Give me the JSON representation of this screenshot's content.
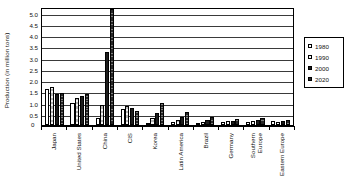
{
  "chart_data": {
    "type": "bar",
    "title": "",
    "xlabel": "",
    "ylabel": "Production (in million tons)",
    "ylim": [
      0,
      5.25
    ],
    "grid": true,
    "legend_position": "right",
    "yticks": [
      "5.0",
      "4.5",
      "4.0",
      "3.5",
      "3.0",
      "2.5",
      "2.0",
      "1.5",
      "1.0",
      "0.5"
    ],
    "ytick_values": [
      5.0,
      4.5,
      4.0,
      3.5,
      3.0,
      2.5,
      2.0,
      1.5,
      1.0,
      0.5
    ],
    "zero_label": "0",
    "categories": [
      "Japan",
      "United States",
      "China",
      "CIS",
      "Korea",
      "Latin America",
      "Brazil",
      "Germany",
      "Southern Europe",
      "Eastern Europe"
    ],
    "category_lines": [
      [
        "Japan"
      ],
      [
        "United States"
      ],
      [
        "China"
      ],
      [
        "CIS"
      ],
      [
        "Korea"
      ],
      [
        "Latin America"
      ],
      [
        "Brazil"
      ],
      [
        "Germany"
      ],
      [
        "Southern",
        "Europe"
      ],
      [
        "Eastern Europe"
      ]
    ],
    "series": [
      {
        "name": "1980",
        "swatch": "white-open",
        "values": [
          1.6,
          1.0,
          0.3,
          0.7,
          0.1,
          0.14,
          0.06,
          0.14,
          0.14,
          0.16
        ]
      },
      {
        "name": "1990",
        "swatch": "light-hatch",
        "values": [
          1.67,
          1.22,
          0.88,
          0.84,
          0.3,
          0.22,
          0.14,
          0.16,
          0.16,
          0.14
        ]
      },
      {
        "name": "2000",
        "swatch": "solid-black",
        "values": [
          1.37,
          1.28,
          3.27,
          0.77,
          0.55,
          0.34,
          0.22,
          0.18,
          0.22,
          0.2
        ]
      },
      {
        "name": "2020",
        "swatch": "dark-hatch",
        "values": [
          1.41,
          1.37,
          5.18,
          0.62,
          0.98,
          0.57,
          0.34,
          0.28,
          0.3,
          0.24
        ]
      }
    ]
  },
  "legend": {
    "items": [
      "1980",
      "1990",
      "2000",
      "2020"
    ]
  }
}
